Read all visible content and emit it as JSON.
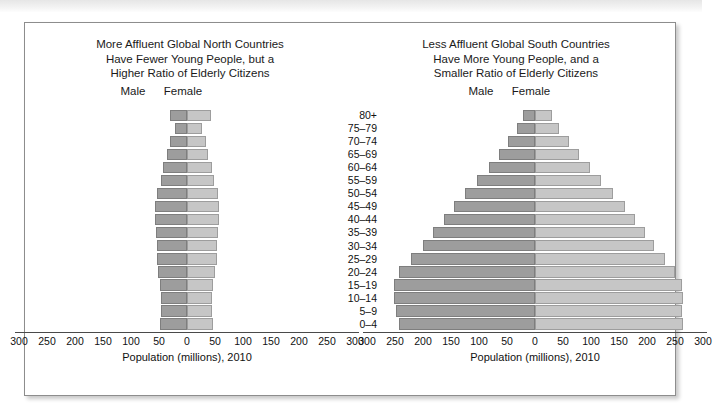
{
  "figure": {
    "axis_label": "Population (millions), 2010",
    "male_label": "Male",
    "female_label": "Female",
    "colors": {
      "male_bar": "#9d9d9d",
      "female_bar": "#c6c6c6",
      "axis": "#4a4a4a",
      "frame": "#8d8d8d"
    }
  },
  "chart_data": [
    {
      "type": "bar",
      "id": "global-north",
      "title": "More Affluent Global North Countries Have Fewer Young People, but a Higher Ratio of Elderly Citizens",
      "title_lines": [
        "More Affluent Global North Countries",
        "Have Fewer Young People, but a",
        "Higher Ratio of Elderly Citizens"
      ],
      "orientation": "horizontal-diverging",
      "xlabel": "Population (millions), 2010",
      "ylabel": "",
      "xlim": [
        -300,
        300
      ],
      "xticks": [
        300,
        250,
        200,
        150,
        100,
        50,
        0,
        50,
        100,
        150,
        200,
        250,
        300
      ],
      "grid": false,
      "legend": [
        "Male",
        "Female"
      ],
      "legend_position": "top",
      "categories": [
        "80+",
        "75–79",
        "70–74",
        "65–69",
        "60–64",
        "55–59",
        "50–54",
        "45–49",
        "40–44",
        "35–39",
        "30–34",
        "25–29",
        "20–24",
        "15–19",
        "10–14",
        "5–9",
        "0–4"
      ],
      "series": [
        {
          "name": "Male",
          "side": "left",
          "values": [
            30,
            22,
            31,
            36,
            43,
            47,
            54,
            57,
            57,
            55,
            53,
            54,
            52,
            49,
            47,
            47,
            49
          ]
        },
        {
          "name": "Female",
          "side": "right",
          "values": [
            42,
            27,
            34,
            38,
            45,
            49,
            55,
            58,
            58,
            55,
            53,
            53,
            50,
            47,
            45,
            45,
            47
          ]
        }
      ]
    },
    {
      "type": "bar",
      "id": "global-south",
      "title": "Less Affluent Global South Countries Have More Young People, and a Smaller Ratio of Elderly Citizens",
      "title_lines": [
        "Less Affluent Global South Countries",
        "Have More Young People, and a",
        "Smaller Ratio of Elderly Citizens"
      ],
      "orientation": "horizontal-diverging",
      "xlabel": "Population (millions), 2010",
      "ylabel": "",
      "xlim": [
        -300,
        300
      ],
      "xticks": [
        300,
        250,
        200,
        150,
        100,
        50,
        0,
        50,
        100,
        150,
        200,
        250,
        300
      ],
      "grid": false,
      "legend": [
        "Male",
        "Female"
      ],
      "legend_position": "top",
      "categories": [
        "80+",
        "75–79",
        "70–74",
        "65–69",
        "60–64",
        "55–59",
        "50–54",
        "45–49",
        "40–44",
        "35–39",
        "30–34",
        "25–29",
        "20–24",
        "15–19",
        "10–14",
        "5–9",
        "0–4"
      ],
      "series": [
        {
          "name": "Male",
          "side": "left",
          "values": [
            22,
            32,
            48,
            64,
            83,
            103,
            125,
            145,
            163,
            183,
            200,
            222,
            243,
            252,
            252,
            248,
            243
          ]
        },
        {
          "name": "Female",
          "side": "right",
          "values": [
            30,
            42,
            60,
            78,
            98,
            118,
            140,
            160,
            178,
            196,
            212,
            232,
            250,
            262,
            265,
            262,
            265
          ]
        }
      ]
    }
  ]
}
